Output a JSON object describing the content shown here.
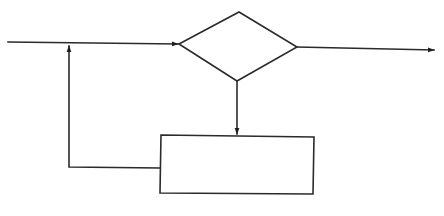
{
  "diagram": {
    "type": "flowchart",
    "colors": {
      "background": "#ffffff",
      "stroke": "#2b2b2b",
      "arrowhead": "#1e1e1e"
    },
    "nodes": [
      {
        "id": "decision",
        "shape": "diamond",
        "label": ""
      },
      {
        "id": "process",
        "shape": "rectangle",
        "label": ""
      }
    ],
    "edges": [
      {
        "id": "input",
        "from": "external-left",
        "to": "decision",
        "label": ""
      },
      {
        "id": "output",
        "from": "decision",
        "to": "external-right",
        "label": ""
      },
      {
        "id": "decision-to-process",
        "from": "decision",
        "to": "process",
        "label": ""
      },
      {
        "id": "feedback",
        "from": "process",
        "to": "input",
        "label": ""
      }
    ],
    "labels": {
      "decision": "",
      "process": "",
      "input": "",
      "output": ""
    }
  }
}
